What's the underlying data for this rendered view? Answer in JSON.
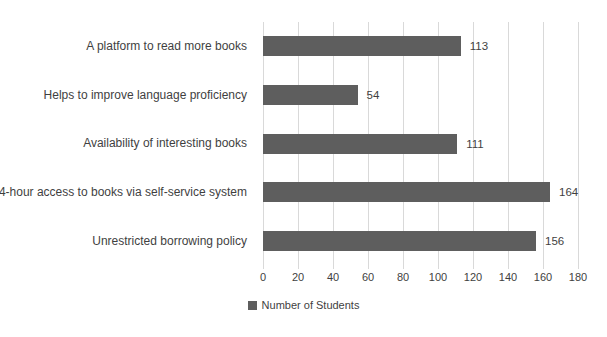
{
  "chart_data": {
    "type": "bar",
    "orientation": "horizontal",
    "categories": [
      "A platform to read more books",
      "Helps to improve language proficiency",
      "Availability of interesting books",
      "24-hour access to books via self-service system",
      "Unrestricted borrowing policy"
    ],
    "values": [
      113,
      54,
      111,
      164,
      156
    ],
    "series_name": "Number of Students",
    "title": "",
    "xlabel": "",
    "ylabel": "",
    "xlim": [
      0,
      180
    ],
    "x_ticks": [
      0,
      20,
      40,
      60,
      80,
      100,
      120,
      140,
      160,
      180
    ],
    "grid": true,
    "legend_position": "bottom",
    "data_labels": true,
    "bar_color": "#5e5e5e",
    "gridline_color": "#d9d9d9",
    "text_color": "#3f3f3f"
  },
  "legend": {
    "label": "Number of Students"
  }
}
